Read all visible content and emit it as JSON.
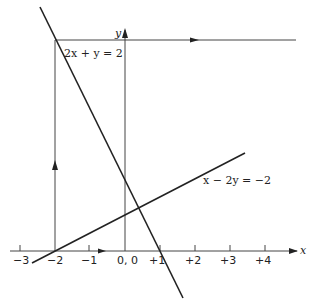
{
  "diagram": {
    "axes": {
      "x_label": "x",
      "y_label": "y",
      "origin_label": "0, 0"
    },
    "ticks": [
      {
        "label": "−3",
        "value": -3
      },
      {
        "label": "−2",
        "value": -2
      },
      {
        "label": "−1",
        "value": -1
      },
      {
        "label": "0, 0",
        "value": 0
      },
      {
        "label": "+1",
        "value": 1
      },
      {
        "label": "+2",
        "value": 2
      },
      {
        "label": "+3",
        "value": 3
      },
      {
        "label": "+4",
        "value": 4
      }
    ],
    "lines": [
      {
        "equation": "2x + y = 2"
      },
      {
        "equation": "x − 2y = −2"
      }
    ],
    "colors": {
      "stroke": "#222222",
      "background": "#ffffff"
    }
  }
}
